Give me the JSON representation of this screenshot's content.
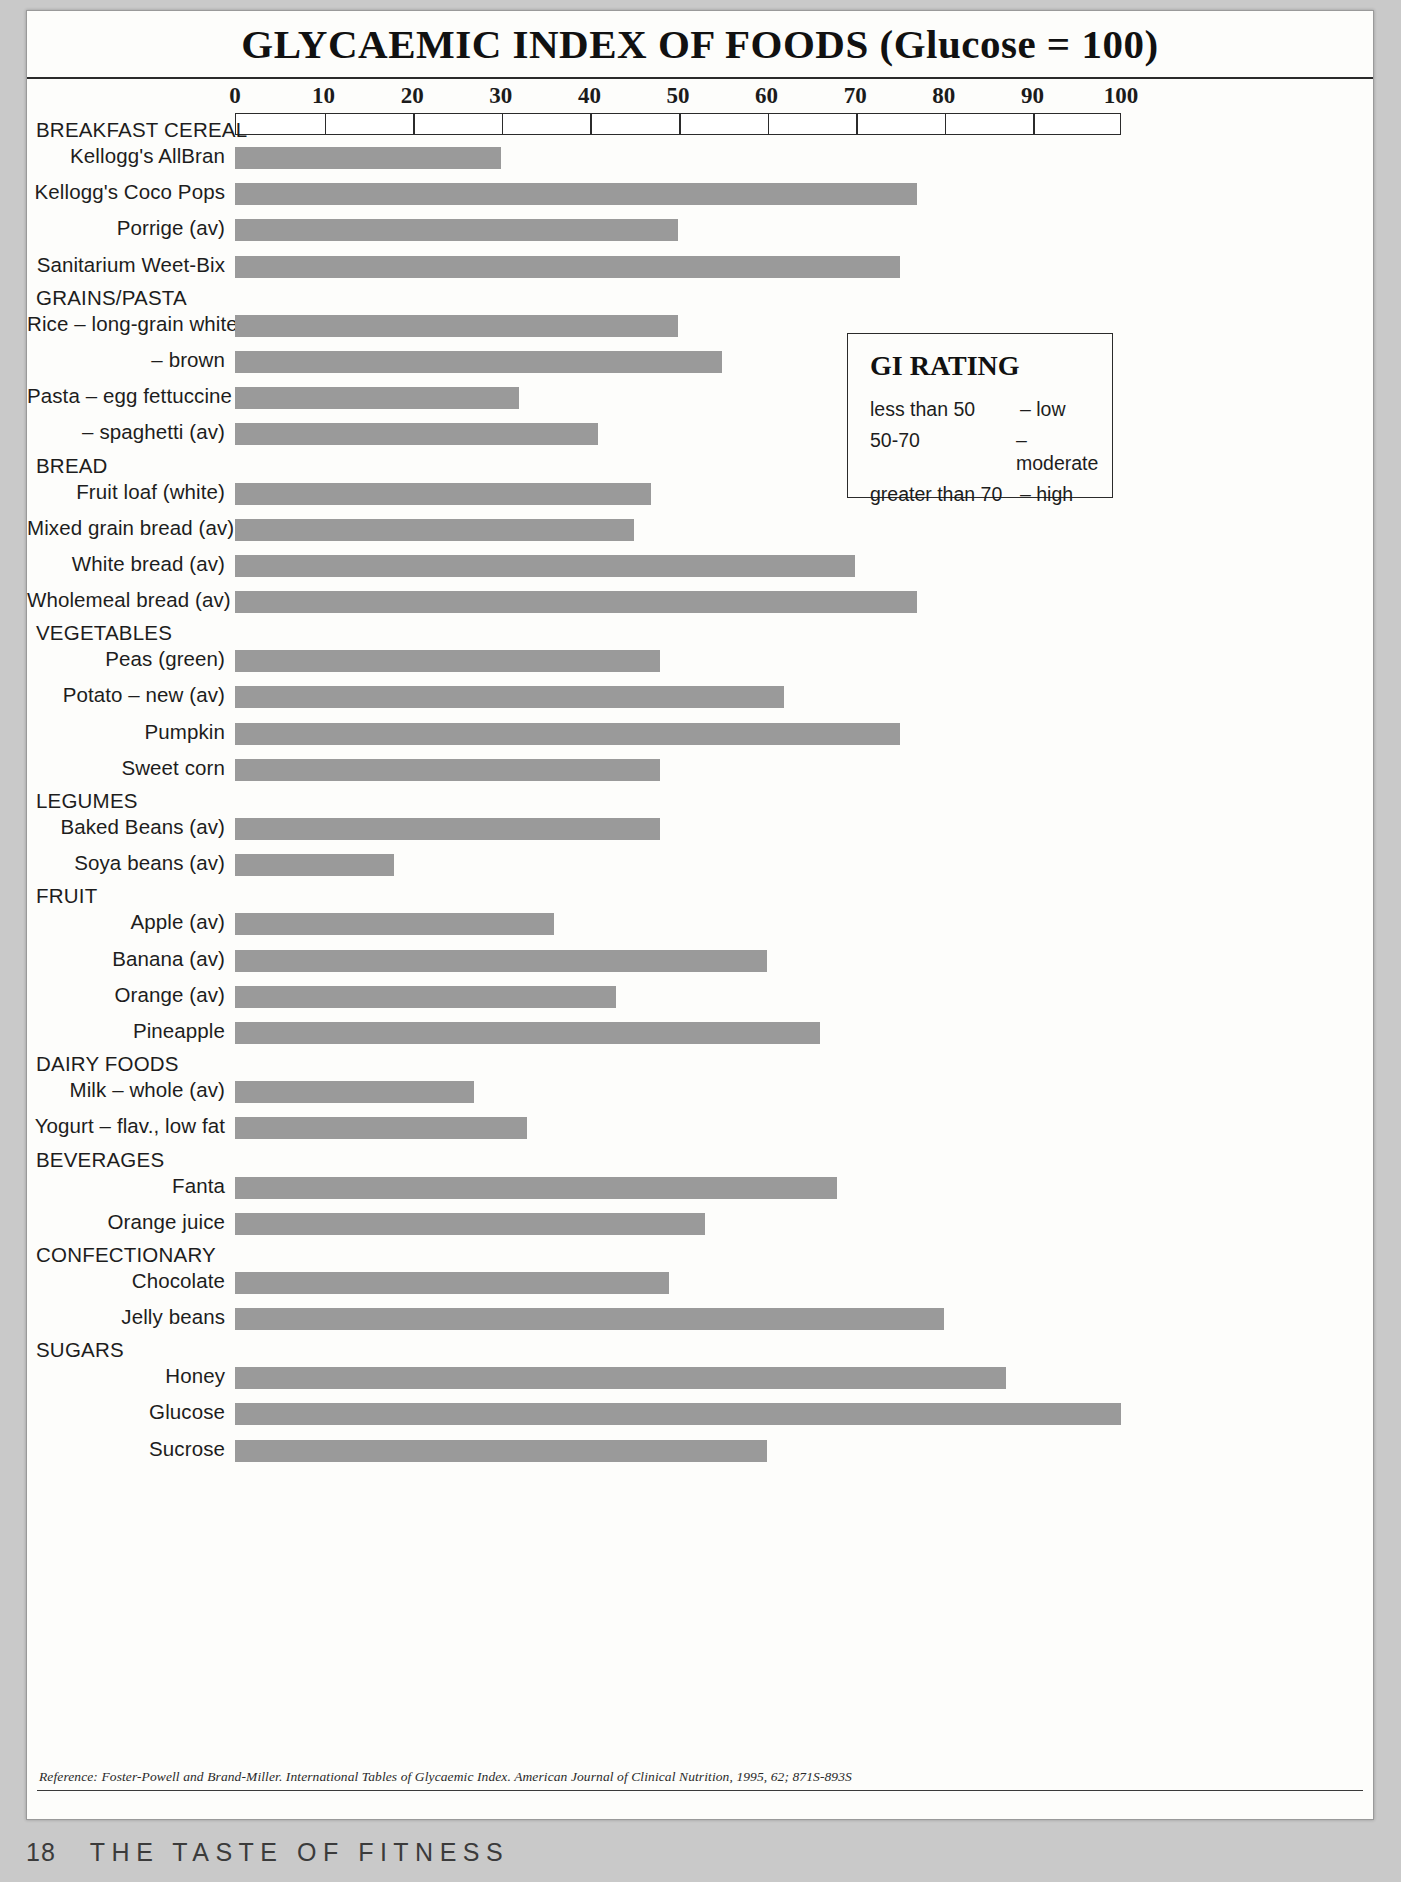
{
  "page": {
    "title": "GLYCAEMIC INDEX OF FOODS (Glucose = 100)",
    "page_number": "18",
    "book_title": "THE TASTE OF FITNESS",
    "reference": "Reference: Foster-Powell and Brand-Miller. International Tables of Glycaemic Index. American Journal of Clinical Nutrition, 1995, 62; 871S-893S"
  },
  "legend": {
    "title": "GI RATING",
    "rows": [
      {
        "range": "less than 50",
        "rating": "– low"
      },
      {
        "range": "50-70",
        "rating": "– moderate"
      },
      {
        "range": "greater than 70",
        "rating": "– high"
      }
    ]
  },
  "chart_data": {
    "type": "bar",
    "orientation": "horizontal",
    "title": "GLYCAEMIC INDEX OF FOODS (Glucose = 100)",
    "xlabel": "",
    "ylabel": "",
    "xlim": [
      0,
      100
    ],
    "xticks": [
      0,
      10,
      20,
      30,
      40,
      50,
      60,
      70,
      80,
      90,
      100
    ],
    "xtick_labels": [
      "0",
      "10",
      "20",
      "30",
      "40",
      "50",
      "60",
      "70",
      "80",
      "90",
      "100"
    ],
    "grid": false,
    "legend_position": "right",
    "bar_color": "#9a9a9a",
    "groups": [
      {
        "name": "BREAKFAST CEREAL",
        "items": [
          {
            "label": "Kellogg's AllBran",
            "value": 30
          },
          {
            "label": "Kellogg's Coco Pops",
            "value": 77
          },
          {
            "label": "Porrige (av)",
            "value": 50
          },
          {
            "label": "Sanitarium Weet-Bix",
            "value": 75
          }
        ]
      },
      {
        "name": "GRAINS/PASTA",
        "items": [
          {
            "label": "Rice – long-grain white",
            "value": 50
          },
          {
            "label": "– brown",
            "value": 55
          },
          {
            "label": "Pasta – egg fettuccine",
            "value": 32
          },
          {
            "label": "– spaghetti (av)",
            "value": 41
          }
        ]
      },
      {
        "name": "BREAD",
        "items": [
          {
            "label": "Fruit loaf (white)",
            "value": 47
          },
          {
            "label": "Mixed grain bread (av)",
            "value": 45
          },
          {
            "label": "White bread (av)",
            "value": 70
          },
          {
            "label": "Wholemeal bread (av)",
            "value": 77
          }
        ]
      },
      {
        "name": "VEGETABLES",
        "items": [
          {
            "label": "Peas (green)",
            "value": 48
          },
          {
            "label": "Potato – new (av)",
            "value": 62
          },
          {
            "label": "Pumpkin",
            "value": 75
          },
          {
            "label": "Sweet corn",
            "value": 48
          }
        ]
      },
      {
        "name": "LEGUMES",
        "items": [
          {
            "label": "Baked Beans (av)",
            "value": 48
          },
          {
            "label": "Soya beans (av)",
            "value": 18
          }
        ]
      },
      {
        "name": "FRUIT",
        "items": [
          {
            "label": "Apple (av)",
            "value": 36
          },
          {
            "label": "Banana (av)",
            "value": 60
          },
          {
            "label": "Orange (av)",
            "value": 43
          },
          {
            "label": "Pineapple",
            "value": 66
          }
        ]
      },
      {
        "name": "DAIRY FOODS",
        "items": [
          {
            "label": "Milk – whole (av)",
            "value": 27
          },
          {
            "label": "Yogurt – flav., low fat",
            "value": 33
          }
        ]
      },
      {
        "name": "BEVERAGES",
        "items": [
          {
            "label": "Fanta",
            "value": 68
          },
          {
            "label": "Orange juice",
            "value": 53
          }
        ]
      },
      {
        "name": "CONFECTIONARY",
        "items": [
          {
            "label": "Chocolate",
            "value": 49
          },
          {
            "label": "Jelly beans",
            "value": 80
          }
        ]
      },
      {
        "name": "SUGARS",
        "items": [
          {
            "label": "Honey",
            "value": 87
          },
          {
            "label": "Glucose",
            "value": 100
          },
          {
            "label": "Sucrose",
            "value": 60
          }
        ]
      }
    ]
  }
}
